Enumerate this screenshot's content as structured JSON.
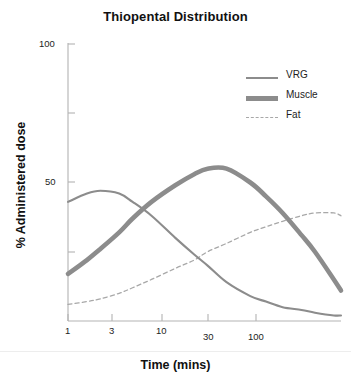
{
  "chart_data": {
    "type": "line",
    "title": "Thiopental Distribution",
    "xlabel": "Time (mins)",
    "ylabel": "% Administered dose",
    "xscale": "log",
    "xlim": [
      1,
      350
    ],
    "ylim": [
      0,
      100
    ],
    "grid": false,
    "legend_position": "top-right",
    "x_ticks": [
      {
        "value": 1,
        "label": "1"
      },
      {
        "value": 3,
        "label": "3"
      },
      {
        "value": 10,
        "label": "10"
      },
      {
        "value": 30,
        "label": "30"
      },
      {
        "value": 100,
        "label": "100"
      }
    ],
    "y_ticks": [
      {
        "value": 100,
        "label": "100"
      },
      {
        "value": 75,
        "label": ""
      },
      {
        "value": 50,
        "label": "50"
      },
      {
        "value": 25,
        "label": ""
      }
    ],
    "x": [
      1,
      1.5,
      2,
      3,
      4,
      6,
      10,
      15,
      20,
      30,
      50,
      70,
      100,
      150,
      200,
      300,
      350
    ],
    "series": [
      {
        "name": "VRG",
        "style": "solid-thin",
        "color": "#8c8c8c",
        "values": [
          43,
          46,
          47,
          46,
          43,
          38,
          30,
          24,
          20,
          14,
          9,
          7,
          5,
          4,
          3,
          2,
          2
        ]
      },
      {
        "name": "Muscle",
        "style": "solid-thick",
        "color": "#8c8c8c",
        "values": [
          17,
          22,
          26,
          32,
          37,
          43,
          49,
          53,
          55,
          55,
          50,
          45,
          39,
          31,
          25,
          15,
          11
        ]
      },
      {
        "name": "Fat",
        "style": "dashed-thin",
        "color": "#a8a8a8",
        "values": [
          6,
          7,
          8,
          10,
          12,
          15,
          19,
          22,
          25,
          28,
          32,
          34,
          36,
          38,
          39,
          39,
          38
        ]
      }
    ],
    "colors": {
      "vrg": "#8c8c8c",
      "muscle": "#8c8c8c",
      "fat": "#a8a8a8",
      "axis": "#b0b0b0",
      "text": "#1d1d1d",
      "background": "#ffffff"
    }
  },
  "legend": {
    "items": [
      {
        "label": "VRG",
        "swatch": "line-thin-solid"
      },
      {
        "label": "Muscle",
        "swatch": "line-thick-solid"
      },
      {
        "label": "Fat",
        "swatch": "line-thin-dashed"
      }
    ]
  },
  "labels": {
    "title": "Thiopental Distribution",
    "y_axis_title": "% Administered dose",
    "x_axis_title": "Time (mins)",
    "x_tick_1": "1",
    "x_tick_3": "3",
    "x_tick_10": "10",
    "x_tick_30": "30",
    "x_tick_100": "100",
    "y_tick_100": "100",
    "y_tick_50": "50",
    "corner_mark": ""
  }
}
